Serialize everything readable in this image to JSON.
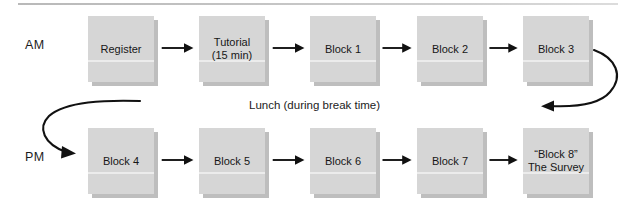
{
  "diagram": {
    "top_rule": "horizontal-rule",
    "periods": [
      {
        "id": "am",
        "label": "AM"
      },
      {
        "id": "pm",
        "label": "PM"
      }
    ],
    "rows": [
      {
        "id": "am-row",
        "period": "AM",
        "boxes": [
          {
            "id": "register",
            "label": "Register"
          },
          {
            "id": "tutorial",
            "label": "Tutorial\n(15 min)"
          },
          {
            "id": "block-1",
            "label": "Block 1"
          },
          {
            "id": "block-2",
            "label": "Block 2"
          },
          {
            "id": "block-3",
            "label": "Block 3"
          }
        ]
      },
      {
        "id": "pm-row",
        "period": "PM",
        "boxes": [
          {
            "id": "block-4",
            "label": "Block 4"
          },
          {
            "id": "block-5",
            "label": "Block 5"
          },
          {
            "id": "block-6",
            "label": "Block 6"
          },
          {
            "id": "block-7",
            "label": "Block 7"
          },
          {
            "id": "block-8",
            "label": "“Block 8”\nThe Survey"
          }
        ]
      }
    ],
    "break_note": "Lunch (during break time)",
    "connectors": {
      "straight": "arrow-right",
      "wrap_right": "curved-arrow-down-left",
      "wrap_left": "curved-arrow-down-right"
    },
    "colors": {
      "box_fill": "#d6d6d6",
      "box_shadow": "#969696",
      "stroke": "#111111",
      "text": "#1a1a1a",
      "rule": "#c4c4c4"
    }
  }
}
